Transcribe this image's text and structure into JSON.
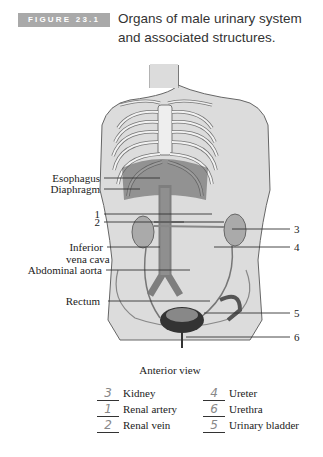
{
  "figure": {
    "badge": "FIGURE 23.1",
    "title_line1": "Organs of male urinary system",
    "title_line2": "and associated structures."
  },
  "labels_left": {
    "esophagus": "Esophagus",
    "diaphragm": "Diaphragm",
    "num1": "1",
    "num2": "2",
    "ivc_line1": "Inferior",
    "ivc_line2": "vena cava",
    "aorta": "Abdominal aorta",
    "rectum": "Rectum"
  },
  "labels_right": {
    "num3": "3",
    "num4": "4",
    "num5": "5",
    "num6": "6"
  },
  "caption": "Anterior view",
  "answer_key": {
    "left": [
      {
        "answer": "3",
        "term": "Kidney"
      },
      {
        "answer": "1",
        "term": "Renal artery"
      },
      {
        "answer": "2",
        "term": "Renal vein"
      }
    ],
    "right": [
      {
        "answer": "4",
        "term": "Ureter"
      },
      {
        "answer": "6",
        "term": "Urethra"
      },
      {
        "answer": "5",
        "term": "Urinary bladder"
      }
    ]
  },
  "colors": {
    "badge_bg": "#a9a9a9",
    "body_fill": "#d9d9d9",
    "outline": "#555555",
    "organ_dark": "#3a3a3a",
    "aorta": "#8a8a8a"
  }
}
